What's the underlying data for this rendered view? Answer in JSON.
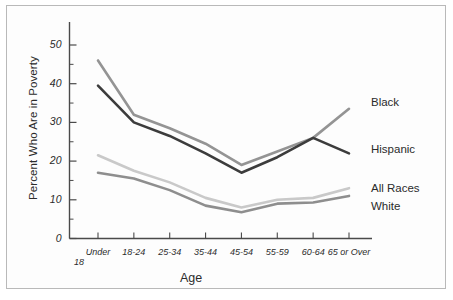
{
  "figure": {
    "background_color": "#ffffff",
    "border_color": "#b9b9b9"
  },
  "chart_data": {
    "type": "line",
    "title": "",
    "xlabel": "Age",
    "ylabel": "Percent Who Are in Poverty",
    "categories": [
      "Under 18",
      "18-24",
      "25-34",
      "35-44",
      "45-54",
      "55-59",
      "60-64",
      "65 or Over"
    ],
    "category_lines": [
      [
        "Under",
        "18"
      ],
      [
        "18-24",
        ""
      ],
      [
        "25-34",
        ""
      ],
      [
        "35-44",
        ""
      ],
      [
        "45-54",
        ""
      ],
      [
        "55-59",
        ""
      ],
      [
        "60-64",
        ""
      ],
      [
        "65 or Over",
        ""
      ]
    ],
    "ylim": [
      0,
      55
    ],
    "yticks": [
      0,
      10,
      20,
      30,
      40,
      50
    ],
    "ytick_labels": [
      "0",
      "10",
      "20",
      "30",
      "40",
      "50"
    ],
    "yminor_ticks": [
      5,
      15,
      25,
      35,
      45
    ],
    "grid": false,
    "legend_position": "right-inline",
    "series": [
      {
        "name": "Black",
        "color": "#949494",
        "values": [
          46.0,
          32.0,
          28.5,
          24.5,
          19.0,
          22.5,
          26.0,
          33.5
        ]
      },
      {
        "name": "Hispanic",
        "color": "#3c3c3c",
        "values": [
          39.5,
          30.0,
          26.5,
          22.0,
          17.0,
          21.0,
          26.0,
          22.0
        ]
      },
      {
        "name": "All Races",
        "color": "#c9c9c9",
        "values": [
          21.5,
          17.5,
          14.5,
          10.5,
          8.0,
          10.0,
          10.5,
          13.0
        ]
      },
      {
        "name": "White",
        "color": "#8e8e8e",
        "values": [
          17.0,
          15.5,
          12.5,
          8.5,
          6.8,
          9.0,
          9.3,
          11.0
        ]
      }
    ]
  },
  "series_labels": [
    {
      "text": "Black"
    },
    {
      "text": "Hispanic"
    },
    {
      "text": "All Races"
    },
    {
      "text": "White"
    }
  ]
}
